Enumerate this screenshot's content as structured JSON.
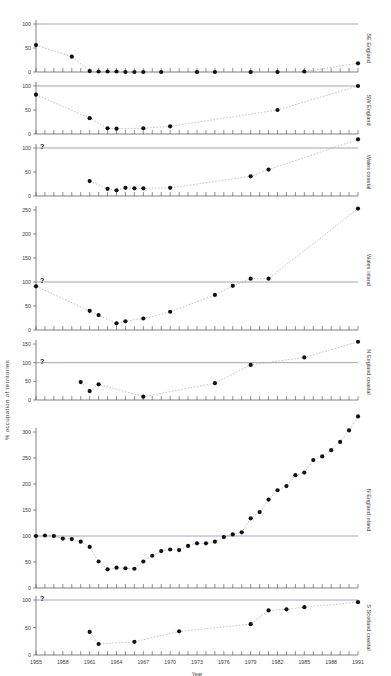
{
  "chart_data": {
    "type": "scatter",
    "title": "",
    "xlabel": "Year",
    "ylabel": "% occupation of territories",
    "xlim": [
      1955,
      1991
    ],
    "xticks": [
      1955,
      1958,
      1961,
      1964,
      1967,
      1970,
      1973,
      1976,
      1979,
      1982,
      1985,
      1988,
      1991
    ],
    "grid": false,
    "reference_line": 100,
    "legend_position": "right-side panel labels",
    "annotation": "?",
    "panels": [
      {
        "name": "SE England",
        "ylim": [
          0,
          100
        ],
        "yticks": [
          0,
          50,
          100
        ],
        "uncertain_start": false,
        "x": [
          1955,
          1959,
          1961,
          1962,
          1963,
          1964,
          1965,
          1966,
          1967,
          1969,
          1973,
          1975,
          1979,
          1982,
          1985,
          1991
        ],
        "y": [
          56,
          32,
          2,
          1,
          1,
          1,
          0,
          0,
          0,
          0,
          0,
          0,
          0,
          0,
          1,
          18
        ]
      },
      {
        "name": "SW England",
        "ylim": [
          0,
          100
        ],
        "yticks": [
          0,
          50,
          100
        ],
        "uncertain_start": false,
        "x": [
          1955,
          1961,
          1963,
          1964,
          1967,
          1970,
          1982,
          1991
        ],
        "y": [
          82,
          33,
          12,
          11,
          12,
          16,
          50,
          100
        ]
      },
      {
        "name": "Wales coastal",
        "ylim": [
          0,
          100
        ],
        "yticks": [
          0,
          50,
          100
        ],
        "uncertain_start": true,
        "x": [
          1961,
          1963,
          1964,
          1965,
          1966,
          1967,
          1970,
          1979,
          1981,
          1991
        ],
        "y": [
          31,
          15,
          12,
          17,
          16,
          16,
          17,
          41,
          55,
          118
        ]
      },
      {
        "name": "Wales inland",
        "ylim": [
          0,
          250
        ],
        "yticks": [
          0,
          50,
          100,
          150,
          200,
          250
        ],
        "uncertain_start": true,
        "x": [
          1955,
          1961,
          1962,
          1964,
          1965,
          1967,
          1970,
          1975,
          1977,
          1979,
          1981,
          1991
        ],
        "y": [
          91,
          40,
          31,
          14,
          18,
          24,
          38,
          73,
          92,
          107,
          107,
          253
        ]
      },
      {
        "name": "N England coastal",
        "ylim": [
          0,
          150
        ],
        "yticks": [
          0,
          50,
          100,
          150
        ],
        "uncertain_start": true,
        "x": [
          1960,
          1961,
          1962,
          1967,
          1975,
          1979,
          1985,
          1991
        ],
        "y": [
          48,
          24,
          42,
          9,
          45,
          94,
          114,
          156
        ]
      },
      {
        "name": "N England inland",
        "ylim": [
          0,
          300
        ],
        "yticks": [
          0,
          50,
          100,
          150,
          200,
          250,
          300
        ],
        "uncertain_start": false,
        "x": [
          1955,
          1956,
          1957,
          1958,
          1959,
          1960,
          1961,
          1962,
          1963,
          1964,
          1965,
          1966,
          1967,
          1968,
          1969,
          1970,
          1971,
          1972,
          1973,
          1974,
          1975,
          1976,
          1977,
          1978,
          1979,
          1980,
          1981,
          1982,
          1983,
          1984,
          1985,
          1986,
          1987,
          1988,
          1989,
          1990,
          1991
        ],
        "y": [
          100,
          101,
          100,
          95,
          94,
          89,
          79,
          51,
          36,
          39,
          38,
          37,
          51,
          62,
          71,
          74,
          73,
          81,
          86,
          86,
          89,
          98,
          103,
          107,
          134,
          146,
          170,
          188,
          196,
          217,
          222,
          246,
          253,
          265,
          281,
          303,
          330
        ]
      },
      {
        "name": "S Scotland coastal",
        "ylim": [
          0,
          100
        ],
        "yticks": [
          0,
          50,
          100
        ],
        "uncertain_start": true,
        "x": [
          1961,
          1962,
          1966,
          1971,
          1979,
          1981,
          1983,
          1985,
          1991
        ],
        "y": [
          42,
          20,
          24,
          43,
          56,
          81,
          83,
          87,
          96
        ]
      }
    ]
  }
}
